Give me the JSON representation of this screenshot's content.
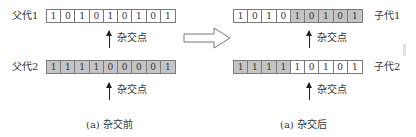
{
  "diagram": {
    "before": {
      "caption": "(a) 杂交前",
      "parent1": {
        "label": "父代1",
        "genes": [
          "1",
          "0",
          "1",
          "0",
          "1",
          "0",
          "1",
          "0",
          "1"
        ],
        "shaded": [
          false,
          false,
          false,
          false,
          false,
          false,
          false,
          false,
          false
        ]
      },
      "parent2": {
        "label": "父代2",
        "genes": [
          "1",
          "1",
          "1",
          "1",
          "0",
          "0",
          "0",
          "0",
          "1"
        ],
        "shaded": [
          true,
          true,
          true,
          true,
          true,
          true,
          true,
          true,
          true
        ]
      },
      "crossover_label_top": "杂交点",
      "crossover_label_bottom": "杂交点"
    },
    "after": {
      "caption": "(a) 杂交后",
      "child1": {
        "label": "子代1",
        "genes": [
          "1",
          "0",
          "1",
          "0",
          "1",
          "0",
          "1",
          "0",
          "1"
        ],
        "shaded": [
          false,
          false,
          false,
          false,
          true,
          true,
          true,
          true,
          true
        ]
      },
      "child2": {
        "label": "子代2",
        "genes": [
          "1",
          "1",
          "1",
          "1",
          "1",
          "0",
          "1",
          "0",
          "1"
        ],
        "shaded": [
          true,
          true,
          true,
          true,
          false,
          false,
          false,
          false,
          false
        ]
      },
      "crossover_label_top": "杂交点",
      "crossover_label_bottom": "杂交点"
    },
    "transition_icon": "hollow-right-arrow",
    "colors": {
      "shaded_gene": "#c4c4c4",
      "border": "#7a7a7a",
      "text": "#333333"
    }
  }
}
